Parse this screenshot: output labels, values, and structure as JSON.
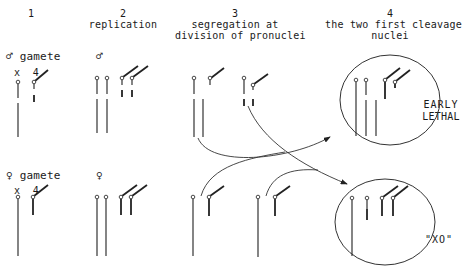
{
  "columns": [
    {
      "number": "1",
      "title": ""
    },
    {
      "number": "2",
      "title": "replication"
    },
    {
      "number": "3",
      "title": "segregation at division of pronuclei",
      "line1": "segregation at",
      "line2": "division of pronuclei"
    },
    {
      "number": "4",
      "title": "the two first cleavage nuclei",
      "line1": "the two first cleavage",
      "line2": "nuclei"
    }
  ],
  "rows": {
    "male": {
      "label": "♂ gamete",
      "symbol": "♂",
      "chromosomes_label": "x  4"
    },
    "female": {
      "label": "♀ gamete",
      "symbol": "♀",
      "chromosomes_label": "x  4"
    }
  },
  "outcomes": {
    "top": "EARLY LETHAL",
    "top_line1": "EARLY",
    "top_line2": "LETHAL",
    "bottom": "\"XO\""
  }
}
